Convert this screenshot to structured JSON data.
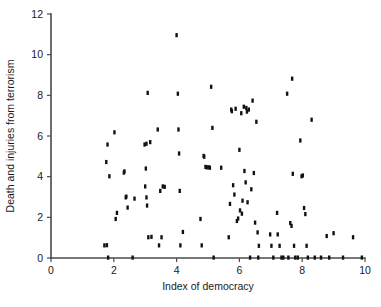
{
  "chart_data": {
    "type": "scatter",
    "title": "",
    "xlabel": "Index of democracy",
    "ylabel": "Death and injuries from terrorism",
    "xlim": [
      0,
      10
    ],
    "ylim": [
      0,
      12
    ],
    "xticks": [
      0,
      2,
      4,
      6,
      8,
      10
    ],
    "yticks": [
      0,
      2,
      4,
      6,
      8,
      10,
      12
    ],
    "xtick_labels": [
      "0",
      "2",
      "4",
      "6",
      "8",
      "10"
    ],
    "ytick_labels": [
      "0",
      "2",
      "4",
      "6",
      "8",
      "10",
      "12"
    ],
    "grid": false,
    "legend": null,
    "marker": "square",
    "marker_color": "#111111",
    "axis_color": "#4a4a4a",
    "points": [
      [
        1.7,
        0.62
      ],
      [
        1.78,
        0.63
      ],
      [
        1.76,
        4.72
      ],
      [
        1.8,
        5.58
      ],
      [
        1.82,
        0.02
      ],
      [
        1.86,
        4.02
      ],
      [
        2.02,
        6.18
      ],
      [
        2.06,
        1.92
      ],
      [
        2.1,
        2.22
      ],
      [
        2.32,
        4.2
      ],
      [
        2.34,
        4.26
      ],
      [
        2.38,
        2.98
      ],
      [
        2.4,
        3.02
      ],
      [
        2.44,
        2.48
      ],
      [
        2.6,
        0.02
      ],
      [
        2.66,
        2.92
      ],
      [
        2.98,
        5.58
      ],
      [
        3.02,
        4.4
      ],
      [
        3.04,
        5.62
      ],
      [
        3.06,
        2.58
      ],
      [
        3.0,
        3.52
      ],
      [
        3.04,
        2.98
      ],
      [
        3.08,
        8.12
      ],
      [
        3.1,
        1.02
      ],
      [
        3.16,
        5.7
      ],
      [
        3.2,
        1.04
      ],
      [
        3.4,
        6.32
      ],
      [
        3.44,
        0.62
      ],
      [
        3.48,
        3.3
      ],
      [
        3.52,
        1.02
      ],
      [
        3.56,
        3.52
      ],
      [
        3.62,
        3.5
      ],
      [
        4.0,
        10.96
      ],
      [
        4.04,
        8.08
      ],
      [
        4.06,
        6.32
      ],
      [
        4.08,
        5.14
      ],
      [
        4.1,
        3.3
      ],
      [
        4.12,
        0.62
      ],
      [
        4.2,
        1.28
      ],
      [
        4.76,
        1.92
      ],
      [
        4.8,
        0.62
      ],
      [
        4.86,
        5.02
      ],
      [
        4.88,
        4.98
      ],
      [
        4.92,
        4.48
      ],
      [
        4.96,
        4.46
      ],
      [
        5.02,
        4.46
      ],
      [
        5.06,
        4.44
      ],
      [
        5.1,
        8.42
      ],
      [
        5.14,
        6.4
      ],
      [
        5.18,
        0.02
      ],
      [
        5.42,
        4.44
      ],
      [
        5.66,
        1.02
      ],
      [
        5.7,
        2.66
      ],
      [
        5.74,
        7.3
      ],
      [
        5.76,
        7.22
      ],
      [
        5.8,
        3.58
      ],
      [
        5.84,
        3.12
      ],
      [
        5.88,
        7.34
      ],
      [
        5.92,
        1.82
      ],
      [
        5.96,
        1.94
      ],
      [
        6.0,
        5.32
      ],
      [
        6.02,
        2.34
      ],
      [
        6.06,
        7.12
      ],
      [
        6.08,
        2.18
      ],
      [
        6.1,
        2.82
      ],
      [
        6.14,
        7.44
      ],
      [
        6.16,
        4.28
      ],
      [
        6.2,
        3.72
      ],
      [
        6.22,
        7.38
      ],
      [
        6.24,
        7.2
      ],
      [
        6.26,
        2.74
      ],
      [
        6.3,
        7.3
      ],
      [
        6.34,
        0.02
      ],
      [
        6.38,
        3.38
      ],
      [
        6.42,
        7.74
      ],
      [
        6.46,
        4.18
      ],
      [
        6.5,
        1.74
      ],
      [
        6.54,
        6.7
      ],
      [
        6.58,
        1.26
      ],
      [
        6.6,
        0.02
      ],
      [
        6.62,
        0.6
      ],
      [
        6.98,
        1.16
      ],
      [
        7.02,
        0.6
      ],
      [
        7.08,
        0.02
      ],
      [
        7.2,
        2.22
      ],
      [
        7.22,
        1.16
      ],
      [
        7.28,
        0.6
      ],
      [
        7.34,
        0.02
      ],
      [
        7.4,
        0.02
      ],
      [
        7.52,
        8.08
      ],
      [
        7.56,
        0.02
      ],
      [
        7.62,
        1.72
      ],
      [
        7.66,
        1.58
      ],
      [
        7.68,
        8.82
      ],
      [
        7.7,
        4.14
      ],
      [
        7.74,
        0.6
      ],
      [
        7.78,
        0.02
      ],
      [
        7.86,
        0.02
      ],
      [
        7.94,
        5.78
      ],
      [
        7.98,
        4.02
      ],
      [
        8.02,
        4.06
      ],
      [
        8.06,
        2.46
      ],
      [
        8.1,
        2.16
      ],
      [
        8.14,
        0.6
      ],
      [
        8.18,
        0.02
      ],
      [
        8.3,
        6.8
      ],
      [
        8.4,
        0.02
      ],
      [
        8.6,
        0.02
      ],
      [
        8.78,
        1.08
      ],
      [
        8.86,
        0.02
      ],
      [
        9.0,
        1.22
      ],
      [
        9.3,
        0.02
      ],
      [
        9.62,
        1.02
      ],
      [
        9.9,
        0.02
      ]
    ]
  },
  "axes": {
    "x_title": "Index of democracy",
    "y_title": "Death and injuries from terrorism"
  }
}
